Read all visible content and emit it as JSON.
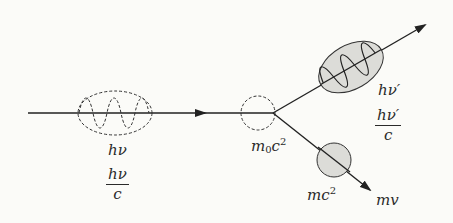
{
  "diagram": {
    "colors": {
      "line": "#222222",
      "fill_gray": "#dcdcd8",
      "background": "#fbfbf8"
    },
    "incident_photon": {
      "energy_label": "hν",
      "momentum_num": "hν",
      "momentum_den": "c"
    },
    "electron_rest": {
      "energy_label_base": "m",
      "energy_label_sub": "0",
      "energy_label_mid": "c",
      "energy_label_sup": "2"
    },
    "scattered_photon": {
      "energy_label": "hν′",
      "momentum_num": "hν′",
      "momentum_den": "c"
    },
    "recoil_electron": {
      "energy_label_base": "mc",
      "energy_label_sup": "2",
      "momentum_label": "mv"
    }
  }
}
